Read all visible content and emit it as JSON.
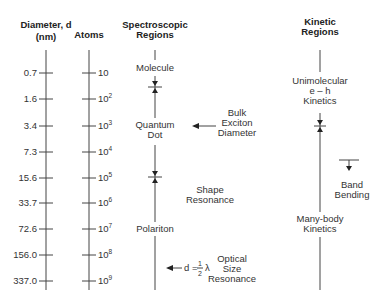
{
  "headers": {
    "diameter_line1": "Diameter, d",
    "diameter_line2": "(nm)",
    "atoms": "Atoms",
    "spectroscopic_line1": "Spectroscopic",
    "spectroscopic_line2": "Regions",
    "kinetic_line1": "Kinetic",
    "kinetic_line2": "Regions"
  },
  "diameter_ticks": [
    "0.7",
    "1.6",
    "3.4",
    "7.3",
    "15.6",
    "33.7",
    "72.6",
    "156.0",
    "337.0"
  ],
  "atoms_ticks": [
    {
      "base": "10",
      "exp": ""
    },
    {
      "base": "10",
      "exp": "2"
    },
    {
      "base": "10",
      "exp": "3"
    },
    {
      "base": "10",
      "exp": "4"
    },
    {
      "base": "10",
      "exp": "5"
    },
    {
      "base": "10",
      "exp": "6"
    },
    {
      "base": "10",
      "exp": "7"
    },
    {
      "base": "10",
      "exp": "8"
    },
    {
      "base": "10",
      "exp": "9"
    }
  ],
  "spectroscopic": {
    "molecule": "Molecule",
    "quantum_line1": "Quantum",
    "quantum_line2": "Dot",
    "polariton": "Polariton"
  },
  "annotations": {
    "bulk_line1": "Bulk",
    "bulk_line2": "Exciton",
    "bulk_line3": "Diameter",
    "shape_line1": "Shape",
    "shape_line2": "Resonance",
    "optical_formula_d": "d =",
    "optical_formula_num": "1",
    "optical_formula_den": "2",
    "optical_formula_lambda": "λ",
    "optical_line1": "Optical",
    "optical_line2": "Size",
    "optical_line3": "Resonance"
  },
  "kinetic": {
    "unimolecular_line1": "Unimolecular",
    "unimolecular_line2": "e – h",
    "unimolecular_line3": "Kinetics",
    "band_line1": "Band",
    "band_line2": "Bending",
    "manybody_line1": "Many-body",
    "manybody_line2": "Kinetics"
  }
}
